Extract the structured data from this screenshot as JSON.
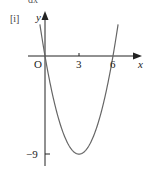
{
  "header": {
    "part_label": "[i]",
    "cut_text": "dx"
  },
  "chart_data": {
    "type": "line",
    "title": "",
    "function": "y = x^2 - 6x",
    "xlabel": "x",
    "ylabel": "y",
    "origin_label": "O",
    "x_ticks": [
      {
        "value": 3,
        "label": "3"
      },
      {
        "value": 6,
        "label": "6"
      }
    ],
    "y_ticks": [
      {
        "value": -9,
        "label": "−9"
      }
    ],
    "points": [
      {
        "x": 0,
        "y": 0
      },
      {
        "x": 3,
        "y": -9
      },
      {
        "x": 6,
        "y": 0
      }
    ],
    "xlim": [
      -1.5,
      8.5
    ],
    "ylim": [
      -10,
      4
    ],
    "grid": false,
    "legend": null,
    "colors": {
      "axis": "#222222",
      "curve": "#666666"
    }
  }
}
